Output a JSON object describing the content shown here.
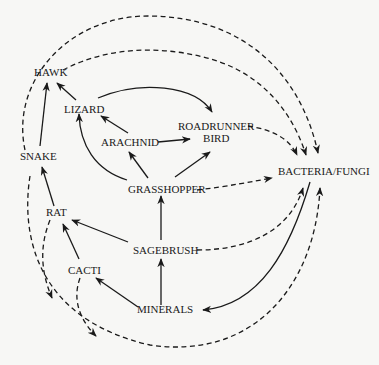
{
  "diagram": {
    "type": "food-web",
    "nodes": [
      {
        "id": "hawk",
        "label": "HAWK"
      },
      {
        "id": "lizard",
        "label": "LIZARD"
      },
      {
        "id": "roadrunner",
        "label_line1": "ROADRUNNER",
        "label_line2": "BIRD"
      },
      {
        "id": "arachnid",
        "label": "ARACHNID"
      },
      {
        "id": "snake",
        "label": "SNAKE"
      },
      {
        "id": "bacteria",
        "label": "BACTERIA/FUNGI"
      },
      {
        "id": "grasshopper",
        "label": "GRASSHOPPER"
      },
      {
        "id": "rat",
        "label": "RAT"
      },
      {
        "id": "sagebrush",
        "label": "SAGEBRUSH"
      },
      {
        "id": "cacti",
        "label": "CACTI"
      },
      {
        "id": "minerals",
        "label": "MINERALS"
      }
    ],
    "edges_solid": [
      {
        "from": "SNAKE",
        "to": "HAWK"
      },
      {
        "from": "LIZARD",
        "to": "HAWK"
      },
      {
        "from": "LIZARD",
        "to": "ROADRUNNER BIRD"
      },
      {
        "from": "ARACHNID",
        "to": "LIZARD"
      },
      {
        "from": "ARACHNID",
        "to": "ROADRUNNER BIRD"
      },
      {
        "from": "GRASSHOPPER",
        "to": "LIZARD"
      },
      {
        "from": "GRASSHOPPER",
        "to": "ARACHNID"
      },
      {
        "from": "GRASSHOPPER",
        "to": "ROADRUNNER BIRD"
      },
      {
        "from": "SAGEBRUSH",
        "to": "GRASSHOPPER"
      },
      {
        "from": "SAGEBRUSH",
        "to": "RAT"
      },
      {
        "from": "RAT",
        "to": "SNAKE"
      },
      {
        "from": "CACTI",
        "to": "RAT"
      },
      {
        "from": "MINERALS",
        "to": "CACTI"
      },
      {
        "from": "MINERALS",
        "to": "SAGEBRUSH"
      },
      {
        "from": "BACTERIA/FUNGI",
        "to": "MINERALS"
      }
    ],
    "edges_dashed": [
      {
        "from": "SNAKE",
        "to": "BACTERIA/FUNGI"
      },
      {
        "from": "HAWK",
        "to": "BACTERIA/FUNGI"
      },
      {
        "from": "ROADRUNNER BIRD",
        "to": "BACTERIA/FUNGI"
      },
      {
        "from": "GRASSHOPPER",
        "to": "BACTERIA/FUNGI"
      },
      {
        "from": "SAGEBRUSH",
        "to": "BACTERIA/FUNGI"
      },
      {
        "from": "RAT",
        "to": "BACTERIA/FUNGI"
      },
      {
        "from": "CACTI",
        "to": "BACTERIA/FUNGI"
      },
      {
        "from": "LIZARD",
        "to": "BACTERIA/FUNGI"
      }
    ],
    "colors": {
      "ink": "#1a1a1a",
      "background": "#f7f7f5"
    }
  }
}
